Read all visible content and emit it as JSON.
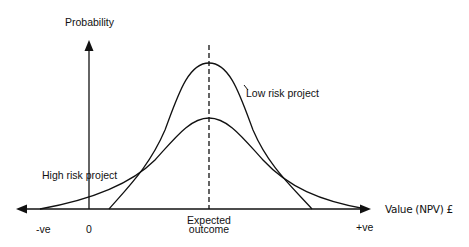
{
  "diagram": {
    "y_axis_label": "Probability",
    "x_axis_label": "Value (NPV) £",
    "x_ticks": {
      "negative": "-ve",
      "zero": "0",
      "positive": "+ve"
    },
    "expected_outcome_label_line1": "Expected",
    "expected_outcome_label_line2": "outcome",
    "curves": [
      {
        "name": "Low risk project",
        "shape": "narrow tall bell curve",
        "peak_at": "Expected outcome"
      },
      {
        "name": "High risk project",
        "shape": "wide flat bell curve",
        "peak_at": "Expected outcome"
      }
    ],
    "low_risk_label": "Low risk project",
    "high_risk_label": "High risk project",
    "colors": {
      "line": "#111111",
      "background": "#ffffff"
    }
  }
}
